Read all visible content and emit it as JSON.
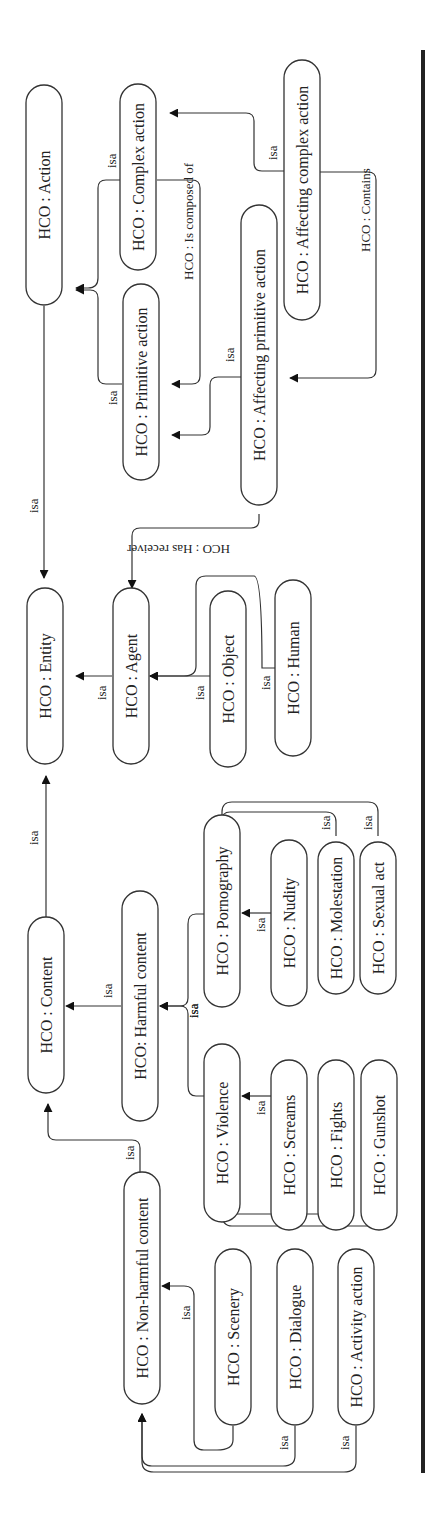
{
  "diagram": {
    "orientation": "rotated-90-ccw",
    "nodes": [
      {
        "id": "entity",
        "label": "HCO : Entity",
        "cx": 45,
        "cy": 676,
        "len": 176
      },
      {
        "id": "action",
        "label": "HCO : Action",
        "cx": 44,
        "cy": 195,
        "len": 220
      },
      {
        "id": "content",
        "label": "HCO : Content",
        "cx": 46,
        "cy": 1005,
        "len": 176
      },
      {
        "id": "agent",
        "label": "HCO : Agent",
        "cx": 131,
        "cy": 676,
        "len": 176
      },
      {
        "id": "primitive_action",
        "label": "HCO : Primitive action",
        "cx": 141,
        "cy": 382,
        "len": 196
      },
      {
        "id": "complex_action",
        "label": "HCO : Complex action",
        "cx": 138,
        "cy": 177,
        "len": 186
      },
      {
        "id": "harmful_content",
        "label": "HCO: Harmful content",
        "cx": 140,
        "cy": 1006,
        "len": 230
      },
      {
        "id": "non_harmful_content",
        "label": "HCO : Non-harmful content",
        "cx": 142,
        "cy": 1288,
        "len": 232
      },
      {
        "id": "affecting_primitive_action",
        "label": "HCO : Affecting primitive action",
        "cx": 259,
        "cy": 355,
        "len": 300
      },
      {
        "id": "affecting_complex_action",
        "label": "HCO : Affecting complex action",
        "cx": 302,
        "cy": 190,
        "len": 260
      },
      {
        "id": "object",
        "label": "HCO : Object",
        "cx": 228,
        "cy": 679,
        "len": 176
      },
      {
        "id": "human",
        "label": "HCO : Human",
        "cx": 293,
        "cy": 668,
        "len": 176
      },
      {
        "id": "pornography",
        "label": "HCO : Pornography",
        "cx": 222,
        "cy": 911,
        "len": 192
      },
      {
        "id": "violence",
        "label": "HCO : Violence",
        "cx": 222,
        "cy": 1133,
        "len": 178
      },
      {
        "id": "nudity",
        "label": "HCO : Nudity",
        "cx": 289,
        "cy": 923,
        "len": 166
      },
      {
        "id": "screams",
        "label": "HCO : Screams",
        "cx": 289,
        "cy": 1145,
        "len": 170
      },
      {
        "id": "molestation",
        "label": "HCO : Molestation",
        "cx": 336,
        "cy": 918,
        "len": 152
      },
      {
        "id": "fights",
        "label": "HCO : Fights",
        "cx": 336,
        "cy": 1145,
        "len": 170
      },
      {
        "id": "sexual_act",
        "label": "HCO : Sexual act",
        "cx": 378,
        "cy": 918,
        "len": 152
      },
      {
        "id": "gunshot",
        "label": "HCO : Gunshot",
        "cx": 379,
        "cy": 1145,
        "len": 170
      },
      {
        "id": "scenery",
        "label": "HCO : Scenery",
        "cx": 233,
        "cy": 1337,
        "len": 176
      },
      {
        "id": "dialogue",
        "label": "HCO : Dialogue",
        "cx": 295,
        "cy": 1337,
        "len": 176
      },
      {
        "id": "activity_action",
        "label": "HCO : Activity action",
        "cx": 356,
        "cy": 1337,
        "len": 176
      }
    ],
    "edges": [
      {
        "id": "e_action_entity",
        "label": "isa",
        "d": "M44,306 L44,578",
        "lx": 38,
        "ly": 513
      },
      {
        "id": "e_content_entity",
        "label": "isa",
        "d": "M46,917 L46,776",
        "lx": 38,
        "ly": 845
      },
      {
        "id": "e_agent_entity",
        "label": "isa",
        "d": "M112,676 L76,676",
        "lx": 106,
        "ly": 700
      },
      {
        "id": "e_primitive_action",
        "label": "isa",
        "d": "M122,384 L106,384 Q98,384 98,376 L98,298 Q98,290 90,290 L76,290",
        "lx": 117,
        "ly": 405
      },
      {
        "id": "e_complex_action",
        "label": "isa",
        "d": "M120,180 L106,180 Q98,180 98,188 L98,278 Q98,288 88,288 L76,288",
        "lx": 116,
        "ly": 168
      },
      {
        "id": "e_is_composed_of",
        "label": "HCO : Is composed of",
        "d": "M157,180 L192,180 Q200,180 200,188 L200,376 Q200,384 192,384 L172,384",
        "lx": 193,
        "ly": 280
      },
      {
        "id": "e_affecting_primitive_isa",
        "label": "isa",
        "d": "M241,377 L218,377 Q210,377 210,385 L210,427 Q210,435 202,435 L172,435",
        "lx": 234,
        "ly": 362
      },
      {
        "id": "e_affecting_complex_isa",
        "label": "isa",
        "d": "M285,171 L262,171 Q254,171 254,163 L254,121 Q254,113 246,113 L170,113",
        "lx": 277,
        "ly": 160
      },
      {
        "id": "e_contains",
        "label": "HCO : Contains",
        "d": "M320,172 L368,172 Q376,172 376,180 L376,370 Q376,378 368,378 L290,378",
        "lx": 370,
        "ly": 252
      },
      {
        "id": "e_has_receiver",
        "label": "HCO : Has receiver",
        "d": "M259,514 L259,520 Q259,528 251,528 L140,528 Q132,528 132,536 L132,588",
        "lx": 230,
        "ly": 545
      },
      {
        "id": "e_object_agent",
        "label": "isa",
        "d": "M210,676 L150,676",
        "lx": 204,
        "ly": 700
      },
      {
        "id": "e_human_agent",
        "label": "isa",
        "d": "M275,668 L262,668 Q262,576 254,576 L206,576 Q196,576 196,586 L196,666 Q196,676 184,676 L150,676",
        "lx": 270,
        "ly": 690
      },
      {
        "id": "e_pornography_harmful",
        "label": "isa",
        "d": "M204,914 L196,914 Q188,914 188,924 L188,998 Q188,1006 180,1006 L160,1006",
        "lx": 198,
        "ly": 1018
      },
      {
        "id": "e_violence_harmful",
        "label": "isa",
        "d": "M204,1096 L196,1096 Q188,1096 188,1086 L188,1014 Q188,1006 180,1006 L160,1006",
        "lx": 198,
        "ly": 1018
      },
      {
        "id": "e_harmful_content",
        "label": "isa",
        "d": "M121,1006 L66,1006",
        "lx": 112,
        "ly": 998
      },
      {
        "id": "e_nudity_pornography",
        "label": "isa",
        "d": "M271,913 L242,913",
        "lx": 265,
        "ly": 932
      },
      {
        "id": "e_molestation_pornography",
        "label": "isa",
        "d": "M336,836 L336,822 Q336,812 326,812 L230,812 Q222,812 222,820 L222,828",
        "lx": 330,
        "ly": 830
      },
      {
        "id": "e_sexual_act_pornography",
        "label": "isa",
        "d": "M378,836 L378,812 Q378,802 368,802 L232,802 Q222,802 222,812 L222,828",
        "lx": 372,
        "ly": 830
      },
      {
        "id": "e_screams_violence",
        "label": "isa",
        "d": "M271,1096 L242,1096",
        "lx": 265,
        "ly": 1115
      },
      {
        "id": "e_fights_violence",
        "label": "isa",
        "d": "M336,1224 L336,1206 Q336,1214 326,1214 L234,1214 Q222,1214 222,1204 L222,1190",
        "lx": 330,
        "ly": 1200
      },
      {
        "id": "e_gunshot_violence",
        "label": "isa",
        "d": "M380,1224 L380,1216 Q380,1226 368,1226 L232,1226 Q222,1226 222,1214 L222,1190",
        "lx": 374,
        "ly": 1200
      },
      {
        "id": "e_non_harmful_content",
        "label": "isa",
        "d": "M140,1172 L140,1148 Q140,1140 132,1140 L56,1140 Q48,1140 48,1132 L48,1104",
        "lx": 134,
        "ly": 1160
      },
      {
        "id": "e_scenery_nonharmful",
        "label": "isa",
        "d": "M233,1426 L233,1440 Q233,1450 217,1450 L204,1450 Q194,1450 194,1440 L194,1296 Q194,1286 184,1286 L162,1286",
        "lx": 190,
        "ly": 1320
      },
      {
        "id": "e_dialogue_nonharmful",
        "label": "isa",
        "d": "M295,1426 L295,1456 Q295,1466 283,1466 L152,1466 Q142,1466 142,1456 L142,1414",
        "lx": 288,
        "ly": 1450
      },
      {
        "id": "e_activity_nonharmful",
        "label": "isa",
        "d": "M356,1426 L356,1462 Q356,1472 344,1472 L154,1472 Q142,1472 142,1462 L142,1414",
        "lx": 349,
        "ly": 1450
      }
    ]
  }
}
